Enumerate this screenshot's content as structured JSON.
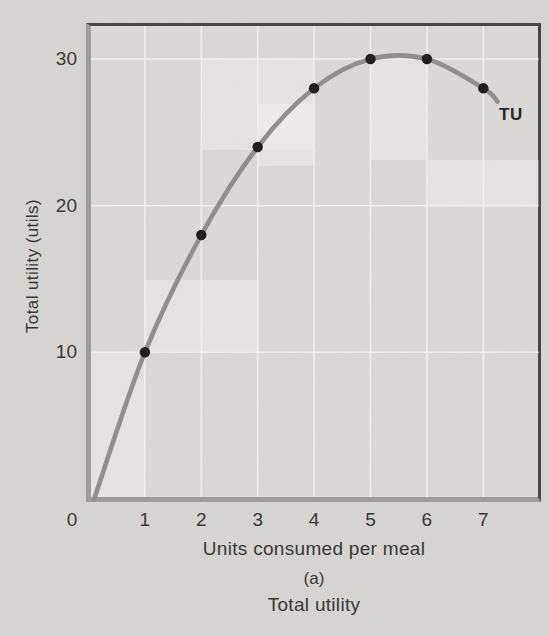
{
  "figure": {
    "panel_label": "(a)",
    "panel_title": "Total utility"
  },
  "chart_data": {
    "type": "line",
    "title": "Total utility",
    "panel": "(a)",
    "xlabel": "Units consumed per meal",
    "ylabel": "Total utility (utils)",
    "curve_label": "TU",
    "series_name": "Total utility (TU)",
    "x": [
      1,
      2,
      3,
      4,
      5,
      6,
      7
    ],
    "values": [
      10,
      18,
      24,
      28,
      30,
      30,
      28
    ],
    "x_ticks": [
      0,
      1,
      2,
      3,
      4,
      5,
      6,
      7
    ],
    "y_ticks": [
      10,
      20,
      30
    ],
    "xlim": [
      0,
      8
    ],
    "ylim": [
      0,
      32.4
    ],
    "grid": true,
    "legend": "none",
    "curve_start": [
      0.1,
      0
    ],
    "curve_end": [
      7.25,
      27.1
    ],
    "colors": {
      "curve": "#8e8d8b",
      "points": "#1a1a18",
      "axis": "#9c9b97",
      "frame": "#434340",
      "gridline": "#f1f0ed",
      "plot_bg": "#dad9d5",
      "page_bg": "#d7d5d1",
      "text": "#333331"
    }
  }
}
